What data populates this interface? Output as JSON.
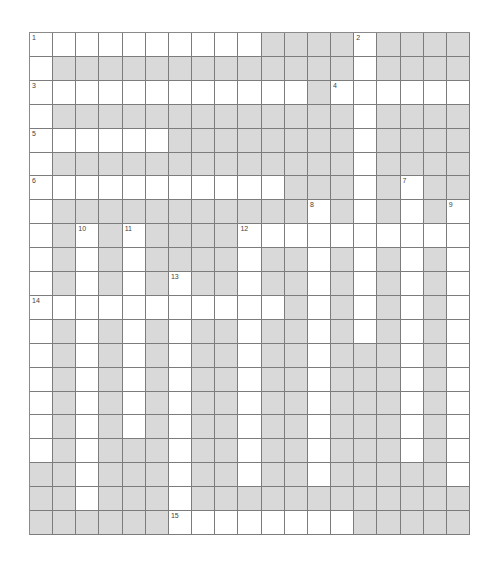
{
  "puzzle": {
    "rows": 21,
    "cols": 19,
    "colors": {
      "block": "#d9d9d9",
      "open": "#ffffff",
      "line": "#7c7c7c",
      "number": "#444444"
    },
    "grid": [
      "1111111111000010000",
      "1000000000000010000",
      "1111111111110111111",
      "1000000000000010000",
      "1111110000000010000",
      "1000000000000010000",
      "1111111111100010100",
      "1000000000001010101",
      "1010100001111111111",
      "1010100001001010101",
      "1010101001001010101",
      "1111111111101010101",
      "1010101001001010101",
      "1010101001001000101",
      "1010101001001000101",
      "1010101001001000101",
      "1010101001001000101",
      "1010001001001000101",
      "0010001001001000001",
      "0010001000000000000",
      "0000001111111100000"
    ],
    "numbers": [
      {
        "r": 0,
        "c": 0,
        "n": "1"
      },
      {
        "r": 0,
        "c": 14,
        "n": "2"
      },
      {
        "r": 2,
        "c": 0,
        "n": "3"
      },
      {
        "r": 2,
        "c": 13,
        "n": "4"
      },
      {
        "r": 4,
        "c": 0,
        "n": "5"
      },
      {
        "r": 6,
        "c": 0,
        "n": "6"
      },
      {
        "r": 6,
        "c": 16,
        "n": "7"
      },
      {
        "r": 7,
        "c": 12,
        "n": "8"
      },
      {
        "r": 7,
        "c": 18,
        "n": "9"
      },
      {
        "r": 8,
        "c": 2,
        "n": "10"
      },
      {
        "r": 8,
        "c": 4,
        "n": "11"
      },
      {
        "r": 8,
        "c": 9,
        "n": "12"
      },
      {
        "r": 10,
        "c": 6,
        "n": "13"
      },
      {
        "r": 11,
        "c": 0,
        "n": "14"
      },
      {
        "r": 20,
        "c": 6,
        "n": "15"
      }
    ]
  }
}
